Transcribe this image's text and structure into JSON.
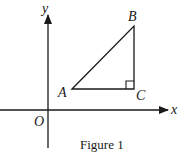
{
  "figure": {
    "caption": "Figure 1",
    "axes": {
      "x_label": "x",
      "y_label": "y",
      "origin_label": "O"
    },
    "points": [
      {
        "name": "A",
        "label": "A"
      },
      {
        "name": "B",
        "label": "B"
      },
      {
        "name": "C",
        "label": "C"
      }
    ],
    "right_angle_at": "C",
    "colors": {
      "stroke": "#1a1a1a",
      "background": "#ffffff"
    }
  }
}
